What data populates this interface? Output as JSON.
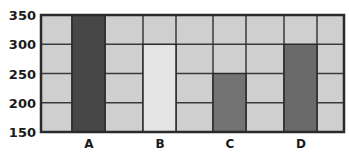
{
  "chart_data": {
    "type": "bar",
    "title": "",
    "xlabel": "",
    "ylabel": "",
    "categories": [
      "A",
      "B",
      "C",
      "D"
    ],
    "values": [
      350,
      300,
      250,
      300
    ],
    "ylim": [
      150,
      350
    ],
    "yticks": [
      "350",
      "300",
      "250",
      "200",
      "150"
    ],
    "grid": true,
    "legend": null,
    "bar_colors": [
      "#474747",
      "#e4e4e4",
      "#737373",
      "#6a6a6a"
    ],
    "background_color": "#cfcfcf"
  }
}
